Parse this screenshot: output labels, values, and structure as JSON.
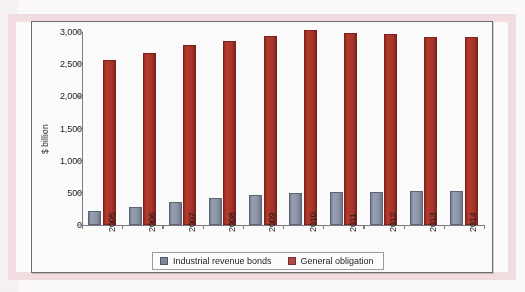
{
  "chart_data": {
    "type": "bar",
    "title": "",
    "xlabel": "",
    "ylabel": "$ billion",
    "categories": [
      "2005",
      "2006",
      "2007",
      "2008",
      "2009",
      "2010",
      "2011",
      "2012",
      "2013",
      "2014"
    ],
    "series": [
      {
        "name": "Industrial revenue bonds",
        "color": "#8b93a6",
        "values": [
          225,
          285,
          355,
          425,
          460,
          490,
          510,
          515,
          530,
          535
        ]
      },
      {
        "name": "General obligation",
        "color": "#a8332a",
        "values": [
          2570,
          2680,
          2800,
          2855,
          2945,
          3030,
          2985,
          2975,
          2930,
          2925
        ]
      }
    ],
    "ylim": [
      0,
      3000
    ],
    "yticks": [
      0,
      500,
      1000,
      1500,
      2000,
      2500,
      3000
    ],
    "ytick_labels": [
      "0",
      "500",
      "1,000",
      "1,500",
      "2,000",
      "2,500",
      "3,000"
    ],
    "grid": false,
    "legend_position": "bottom"
  },
  "legend": {
    "items": [
      {
        "label": "Industrial revenue bonds",
        "swatch": "swatch-gray"
      },
      {
        "label": "General obligation",
        "swatch": "swatch-red"
      }
    ]
  },
  "colors": {
    "series_gray": "#8b93a6",
    "series_red": "#a8332a",
    "axis": "#7a7a80",
    "page_pink": "#f2dde1",
    "frame_border": "#6b6b70"
  }
}
